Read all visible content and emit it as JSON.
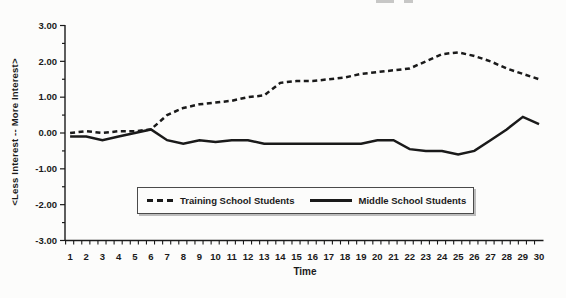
{
  "chart_data": {
    "type": "line",
    "title": "",
    "xlabel": "Time",
    "ylabel": "<Less Interest  --  More Interest>",
    "x": [
      1,
      2,
      3,
      4,
      5,
      6,
      7,
      8,
      9,
      10,
      11,
      12,
      13,
      14,
      15,
      16,
      17,
      18,
      19,
      20,
      21,
      22,
      23,
      24,
      25,
      26,
      27,
      28,
      29,
      30
    ],
    "ylim": [
      -3,
      3
    ],
    "y_tick_values": [
      3,
      2,
      1,
      0,
      -1,
      -2,
      -3
    ],
    "y_tick_labels": [
      "3.00",
      "2.00",
      "1.00",
      "0.00",
      "-1.00",
      "-2.00",
      "-3.00"
    ],
    "grid": false,
    "legend_position": "inside-bottom-center",
    "series": [
      {
        "name": "Training School Students",
        "line_style": "dashed",
        "values": [
          0.0,
          0.05,
          0.0,
          0.05,
          0.05,
          0.1,
          0.5,
          0.7,
          0.8,
          0.85,
          0.9,
          1.0,
          1.05,
          1.4,
          1.45,
          1.45,
          1.5,
          1.55,
          1.65,
          1.7,
          1.75,
          1.8,
          2.0,
          2.2,
          2.25,
          2.15,
          2.0,
          1.8,
          1.65,
          1.5
        ]
      },
      {
        "name": "Middle School Students",
        "line_style": "solid",
        "values": [
          -0.1,
          -0.1,
          -0.2,
          -0.1,
          0.0,
          0.1,
          -0.2,
          -0.3,
          -0.2,
          -0.25,
          -0.2,
          -0.2,
          -0.3,
          -0.3,
          -0.3,
          -0.3,
          -0.3,
          -0.3,
          -0.3,
          -0.2,
          -0.2,
          -0.45,
          -0.5,
          -0.5,
          -0.6,
          -0.5,
          -0.2,
          0.1,
          0.45,
          0.25
        ]
      }
    ]
  },
  "colors": {
    "ink": "#1a1a1a",
    "background": "#fcfcfb",
    "legend_border": "#4a4a4a",
    "legend_shadow": "#bdbdbd"
  }
}
